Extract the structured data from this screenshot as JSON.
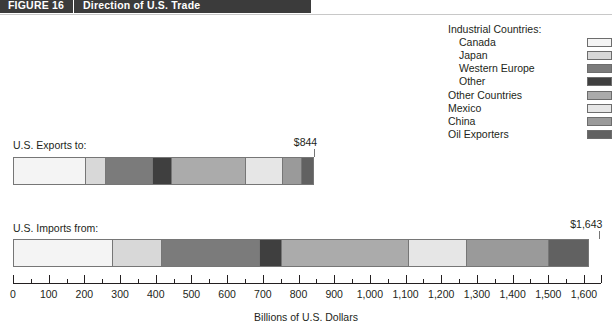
{
  "header": {
    "figure_number": "FIGURE 16",
    "title": "Direction of U.S. Trade"
  },
  "legend": {
    "items": [
      {
        "label": "Industrial Countries:",
        "indent": false,
        "swatch": false,
        "color": ""
      },
      {
        "label": "Canada",
        "indent": true,
        "swatch": true,
        "color": "#f4f4f4"
      },
      {
        "label": "Japan",
        "indent": true,
        "swatch": true,
        "color": "#d8d8d8"
      },
      {
        "label": "Western Europe",
        "indent": true,
        "swatch": true,
        "color": "#7b7b7b"
      },
      {
        "label": "Other",
        "indent": true,
        "swatch": true,
        "color": "#3f3f3f"
      },
      {
        "label": "Other Countries",
        "indent": false,
        "swatch": true,
        "color": "#ababab"
      },
      {
        "label": "Mexico",
        "indent": false,
        "swatch": true,
        "color": "#e6e6e6"
      },
      {
        "label": "China",
        "indent": false,
        "swatch": true,
        "color": "#9a9a9a"
      },
      {
        "label": "Oil Exporters",
        "indent": false,
        "swatch": true,
        "color": "#616161"
      }
    ]
  },
  "labels": {
    "exports": "U.S. Exports to:",
    "imports": "U.S. Imports from:",
    "exports_total": "$844",
    "imports_total": "$1,643"
  },
  "chart_data": {
    "type": "bar",
    "orientation": "horizontal",
    "stacked": true,
    "title": "Direction of U.S. Trade",
    "xlabel": "Billions of U.S. Dollars",
    "ylabel": "",
    "xlim": [
      0,
      1643
    ],
    "axis_max_tick": 1600,
    "grid": false,
    "legend_position": "top-right",
    "tick_labels": [
      "0",
      "100",
      "200",
      "300",
      "400",
      "500",
      "600",
      "700",
      "800",
      "900",
      "1,000",
      "1,100",
      "1,200",
      "1,300",
      "1,400",
      "1,500",
      "1,600"
    ],
    "tick_values": [
      0,
      100,
      200,
      300,
      400,
      500,
      600,
      700,
      800,
      900,
      1000,
      1100,
      1200,
      1300,
      1400,
      1500,
      1600
    ],
    "minor_tick_interval": 50,
    "categories": [
      "U.S. Exports to:",
      "U.S. Imports from:"
    ],
    "series": [
      {
        "name": "Canada",
        "color": "#f4f4f4",
        "values": [
          204,
          280
        ]
      },
      {
        "name": "Japan",
        "color": "#d8d8d8",
        "values": [
          56,
          137
        ]
      },
      {
        "name": "Western Europe",
        "color": "#7b7b7b",
        "values": [
          132,
          274
        ]
      },
      {
        "name": "Other",
        "color": "#3f3f3f",
        "values": [
          53,
          64
        ]
      },
      {
        "name": "Other Countries",
        "color": "#ababab",
        "values": [
          207,
          356
        ]
      },
      {
        "name": "Mexico",
        "color": "#e6e6e6",
        "values": [
          106,
          160
        ]
      },
      {
        "name": "China",
        "color": "#9a9a9a",
        "values": [
          53,
          230
        ]
      },
      {
        "name": "Oil Exporters",
        "color": "#616161",
        "values": [
          33,
          112
        ]
      }
    ],
    "totals": [
      844,
      1643
    ],
    "total_labels": [
      "$844",
      "$1,643"
    ]
  }
}
